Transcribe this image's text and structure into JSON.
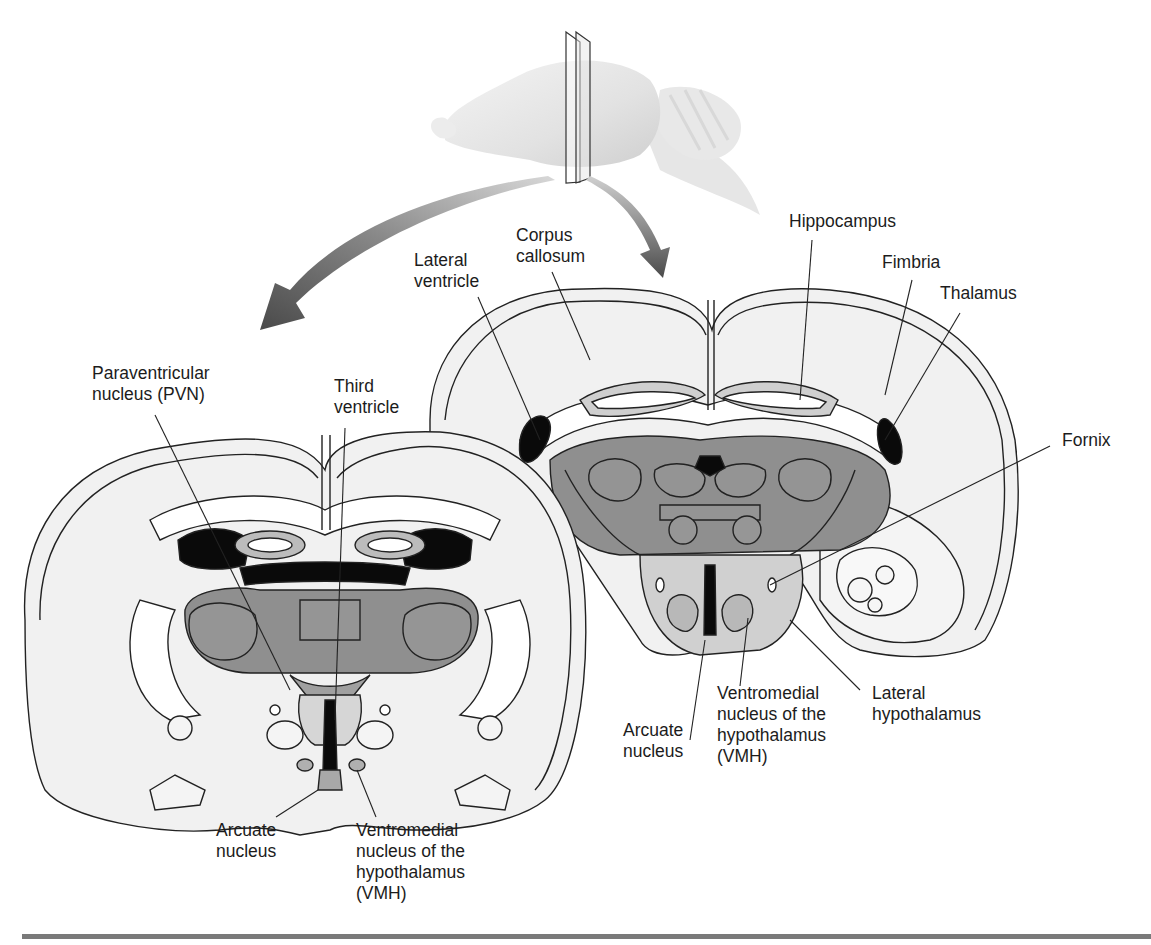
{
  "figure": {
    "colors": {
      "tissue_light": "#f0f0f0",
      "tissue_mid": "#d0d0d0",
      "nucleus_gray": "#8f8f8f",
      "ventricle_black": "#0a0a0a",
      "white_matter": "#ffffff",
      "arrow": "#555555",
      "outline": "#222222",
      "bottom_rule": "#7a7a7a"
    },
    "top_brain": {
      "icon": "sagittal-brain-with-section-planes"
    },
    "arrows": [
      {
        "name": "arrow-to-anterior-section",
        "direction": "down-left"
      },
      {
        "name": "arrow-to-posterior-section",
        "direction": "down"
      }
    ]
  },
  "labels": {
    "lateral_ventricle": [
      "Lateral",
      "ventricle"
    ],
    "corpus_callosum": [
      "Corpus",
      "callosum"
    ],
    "hippocampus": [
      "Hippocampus"
    ],
    "fimbria": [
      "Fimbria"
    ],
    "thalamus": [
      "Thalamus"
    ],
    "fornix": [
      "Fornix"
    ],
    "pvn": [
      "Paraventricular",
      "nucleus (PVN)"
    ],
    "third_ventricle": [
      "Third",
      "ventricle"
    ],
    "arcuate_right": [
      "Arcuate",
      "nucleus"
    ],
    "vmh_right": [
      "Ventromedial",
      "nucleus of the",
      "hypothalamus",
      "(VMH)"
    ],
    "lateral_hypothalamus": [
      "Lateral",
      "hypothalamus"
    ],
    "arcuate_left": [
      "Arcuate",
      "nucleus"
    ],
    "vmh_left": [
      "Ventromedial",
      "nucleus of the",
      "hypothalamus",
      "(VMH)"
    ]
  }
}
